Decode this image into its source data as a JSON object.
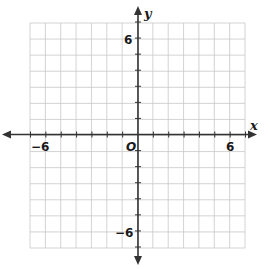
{
  "diagram": {
    "type": "coordinate-plane",
    "x_axis_label": "x",
    "y_axis_label": "y",
    "origin_label": "O",
    "x_range": [
      -7,
      7
    ],
    "y_range": [
      -7,
      7
    ],
    "grid_step": 1,
    "tick_labels": {
      "x_neg": "−6",
      "x_pos": "6",
      "y_pos": "6",
      "y_neg": "−6"
    },
    "colors": {
      "grid": "#c8c8c8",
      "axis": "#333333",
      "background": "#ffffff"
    }
  }
}
